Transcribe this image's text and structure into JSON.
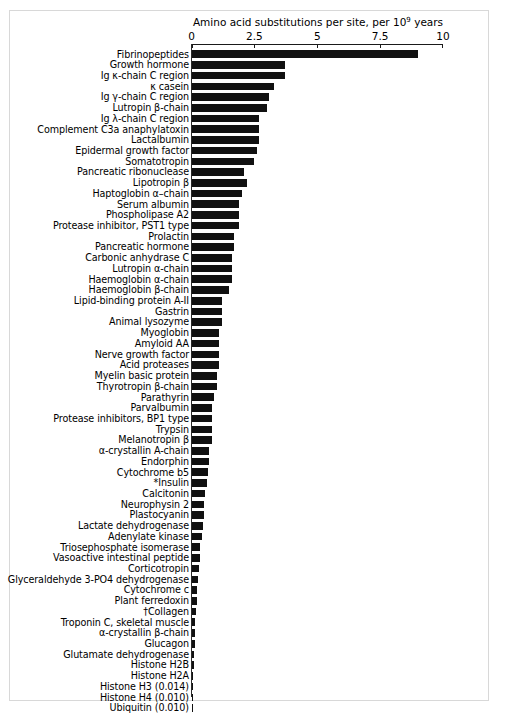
{
  "figure": {
    "axis_title_prefix": "Amino acid substitutions per site, per 10",
    "axis_title_exponent": "9",
    "axis_title_suffix": " years",
    "axis_title_full": "Amino acid substitutions per site, per 10⁹ years"
  },
  "chart_data": {
    "type": "bar",
    "orientation": "horizontal",
    "xlabel": "Amino acid substitutions per site, per 10⁹ years",
    "ylabel": "",
    "xlim": [
      0,
      10
    ],
    "ylim": null,
    "grid": false,
    "legend": null,
    "xticks": [
      0,
      2.5,
      5,
      7.5,
      10
    ],
    "xticklabels": [
      "0",
      "2.5",
      "5",
      "7.5",
      "10"
    ],
    "bar_color": "#111111",
    "categories": [
      "Fibrinopeptides",
      "Growth hormone",
      "Ig κ-chain C region",
      "κ casein",
      "Ig γ-chain C region",
      "Lutropin β-chain",
      "Ig λ-chain C region",
      "Complement C3a anaphylatoxin",
      "Lactalbumin",
      "Epidermal growth factor",
      "Somatotropin",
      "Pancreatic ribonuclease",
      "Lipotropin β",
      "Haptoglobin α–chain",
      "Serum albumin",
      "Phospholipase A2",
      "Protease inhibitor, PST1 type",
      "Prolactin",
      "Pancreatic hormone",
      "Carbonic anhydrase C",
      "Lutropin α-chain",
      "Haemoglobin α-chain",
      "Haemoglobin β-chain",
      "Lipid-binding protein A-II",
      "Gastrin",
      "Animal lysozyme",
      "Myoglobin",
      "Amyloid AA",
      "Nerve growth factor",
      "Acid proteases",
      "Myelin basic protein",
      "Thyrotropin β-chain",
      "Parathyrin",
      "Parvalbumin",
      "Protease inhibitors, BP1 type",
      "Trypsin",
      "Melanotropin β",
      "α-crystallin A-chain",
      "Endorphin",
      "Cytochrome b5",
      "*Insulin",
      "Calcitonin",
      "Neurophysin 2",
      "Plastocyanin",
      "Lactate dehydrogenase",
      "Adenylate kinase",
      "Triosephosphate isomerase",
      "Vasoactive intestinal peptide",
      "Corticotropin",
      "Glyceraldehyde 3-PO4 dehydrogenase",
      "Cytochrome c",
      "Plant ferredoxin",
      "†Collagen",
      "Troponin C, skeletal muscle",
      "α-crystallin β-chain",
      "Glucagon",
      "Glutamate dehydrogenase",
      "Histone H2B",
      "Histone H2A",
      "Histone H3 (0.014)",
      "Histone H4 (0.010)",
      "Ubiquitin (0.010)"
    ],
    "values": [
      9.0,
      3.7,
      3.7,
      3.3,
      3.1,
      3.0,
      2.7,
      2.7,
      2.7,
      2.6,
      2.5,
      2.1,
      2.2,
      2.0,
      1.9,
      1.9,
      1.9,
      1.7,
      1.7,
      1.6,
      1.6,
      1.6,
      1.5,
      1.2,
      1.2,
      1.2,
      1.1,
      1.1,
      1.1,
      1.1,
      1.0,
      1.0,
      0.9,
      0.8,
      0.8,
      0.8,
      0.8,
      0.7,
      0.7,
      0.65,
      0.6,
      0.55,
      0.5,
      0.5,
      0.45,
      0.4,
      0.35,
      0.32,
      0.3,
      0.26,
      0.22,
      0.2,
      0.18,
      0.15,
      0.13,
      0.12,
      0.1,
      0.09,
      0.07,
      0.014,
      0.01,
      0.01
    ]
  }
}
